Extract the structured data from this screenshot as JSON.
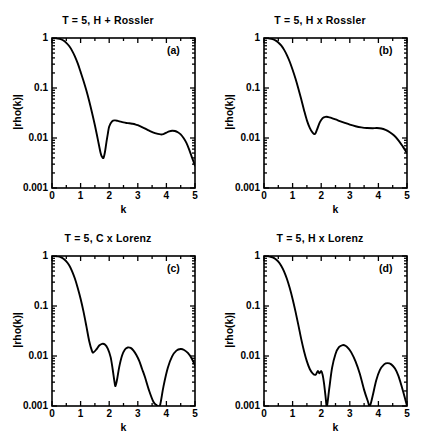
{
  "figure": {
    "background": "#ffffff",
    "ink": "#000000",
    "panel_count": 4
  },
  "shared": {
    "xlabel": "k",
    "ylabel": "|rho(k)|",
    "xticks": [
      "0",
      "1",
      "2",
      "3",
      "4",
      "5"
    ],
    "yticks": [
      "1",
      "0.1",
      "0.01",
      "0.001"
    ],
    "xlim": [
      0,
      5
    ],
    "ylim": [
      0.001,
      1
    ],
    "yscale": "log",
    "grid": false,
    "legend": "none"
  },
  "chart_data": [
    {
      "type": "line",
      "panel": "a",
      "tag": "(a)",
      "title": "T = 5,  H + Rossler",
      "xlabel": "k",
      "ylabel": "|rho(k)|",
      "xlim": [
        0,
        5
      ],
      "ylim": [
        0.001,
        1
      ],
      "yscale": "log",
      "grid": false,
      "xticks": [
        "0",
        "1",
        "2",
        "3",
        "4",
        "5"
      ],
      "yticks": [
        "1",
        "0.1",
        "0.01",
        "0.001"
      ],
      "x": [
        0.0,
        0.1,
        0.2,
        0.3,
        0.4,
        0.5,
        0.6,
        0.7,
        0.8,
        0.9,
        1.0,
        1.1,
        1.2,
        1.3,
        1.4,
        1.5,
        1.6,
        1.7,
        1.75,
        1.8,
        1.85,
        1.9,
        1.95,
        2.0,
        2.1,
        2.2,
        2.3,
        2.4,
        2.5,
        2.6,
        2.7,
        2.8,
        2.9,
        3.0,
        3.2,
        3.4,
        3.6,
        3.8,
        3.9,
        4.0,
        4.1,
        4.2,
        4.3,
        4.4,
        4.5,
        4.6,
        4.7,
        4.8,
        4.9,
        5.0
      ],
      "y": [
        1.0,
        0.995,
        0.98,
        0.95,
        0.89,
        0.8,
        0.69,
        0.56,
        0.43,
        0.31,
        0.21,
        0.14,
        0.09,
        0.055,
        0.032,
        0.018,
        0.0095,
        0.005,
        0.0042,
        0.004,
        0.0052,
        0.008,
        0.012,
        0.017,
        0.0215,
        0.0225,
        0.022,
        0.0212,
        0.0205,
        0.02,
        0.0197,
        0.0193,
        0.0188,
        0.018,
        0.016,
        0.014,
        0.0125,
        0.0118,
        0.012,
        0.0128,
        0.0136,
        0.014,
        0.0138,
        0.013,
        0.0118,
        0.01,
        0.008,
        0.0058,
        0.004,
        0.0028
      ]
    },
    {
      "type": "line",
      "panel": "b",
      "tag": "(b)",
      "title": "T = 5,  H x Rossler",
      "xlabel": "k",
      "ylabel": "|rho(k)|",
      "xlim": [
        0,
        5
      ],
      "ylim": [
        0.001,
        1
      ],
      "yscale": "log",
      "grid": false,
      "xticks": [
        "0",
        "1",
        "2",
        "3",
        "4",
        "5"
      ],
      "yticks": [
        "1",
        "0.1",
        "0.01",
        "0.001"
      ],
      "x": [
        0.0,
        0.1,
        0.2,
        0.3,
        0.4,
        0.5,
        0.6,
        0.7,
        0.8,
        0.9,
        1.0,
        1.1,
        1.2,
        1.3,
        1.4,
        1.5,
        1.6,
        1.7,
        1.78,
        1.85,
        1.95,
        2.05,
        2.15,
        2.25,
        2.35,
        2.5,
        2.65,
        2.8,
        3.0,
        3.2,
        3.4,
        3.6,
        3.8,
        3.95,
        4.1,
        4.25,
        4.4,
        4.55,
        4.7,
        4.85,
        5.0
      ],
      "y": [
        1.0,
        0.995,
        0.98,
        0.95,
        0.895,
        0.815,
        0.71,
        0.585,
        0.455,
        0.335,
        0.232,
        0.155,
        0.098,
        0.06,
        0.036,
        0.0225,
        0.016,
        0.0128,
        0.012,
        0.0145,
        0.0205,
        0.025,
        0.0265,
        0.0262,
        0.0252,
        0.0235,
        0.0218,
        0.0203,
        0.0185,
        0.0172,
        0.0163,
        0.0158,
        0.0157,
        0.0158,
        0.0155,
        0.0145,
        0.013,
        0.0112,
        0.009,
        0.0068,
        0.005
      ]
    },
    {
      "type": "line",
      "panel": "c",
      "tag": "(c)",
      "title": "T = 5,  C x Lorenz",
      "xlabel": "k",
      "ylabel": "|rho(k)|",
      "xlim": [
        0,
        5
      ],
      "ylim": [
        0.001,
        1
      ],
      "yscale": "log",
      "grid": false,
      "xticks": [
        "0",
        "1",
        "2",
        "3",
        "4",
        "5"
      ],
      "yticks": [
        "1",
        "0.1",
        "0.01",
        "0.001"
      ],
      "x": [
        0.0,
        0.1,
        0.2,
        0.3,
        0.4,
        0.5,
        0.6,
        0.7,
        0.8,
        0.9,
        1.0,
        1.1,
        1.2,
        1.3,
        1.4,
        1.45,
        1.55,
        1.65,
        1.75,
        1.85,
        1.95,
        2.05,
        2.12,
        2.18,
        2.22,
        2.28,
        2.35,
        2.45,
        2.55,
        2.65,
        2.75,
        2.85,
        2.95,
        3.05,
        3.15,
        3.25,
        3.4,
        3.55,
        3.65,
        3.7,
        3.78,
        3.9,
        4.05,
        4.2,
        4.35,
        4.5,
        4.62,
        4.75,
        4.88,
        5.0
      ],
      "y": [
        1.0,
        0.995,
        0.98,
        0.945,
        0.88,
        0.78,
        0.65,
        0.5,
        0.355,
        0.23,
        0.14,
        0.078,
        0.04,
        0.02,
        0.0125,
        0.0118,
        0.0135,
        0.0162,
        0.0175,
        0.017,
        0.014,
        0.0095,
        0.0055,
        0.0032,
        0.0025,
        0.0035,
        0.006,
        0.0102,
        0.0135,
        0.0148,
        0.0145,
        0.0128,
        0.0105,
        0.008,
        0.0055,
        0.0038,
        0.002,
        0.0012,
        0.00105,
        0.001,
        0.00105,
        0.0025,
        0.0058,
        0.0098,
        0.0128,
        0.0138,
        0.0132,
        0.0115,
        0.009,
        0.0065
      ]
    },
    {
      "type": "line",
      "panel": "d",
      "tag": "(d)",
      "title": "T = 5,  H x Lorenz",
      "xlabel": "k",
      "ylabel": "|rho(k)|",
      "xlim": [
        0,
        5
      ],
      "ylim": [
        0.001,
        1
      ],
      "yscale": "log",
      "grid": false,
      "xticks": [
        "0",
        "1",
        "2",
        "3",
        "4",
        "5"
      ],
      "yticks": [
        "1",
        "0.1",
        "0.01",
        "0.001"
      ],
      "x": [
        0.0,
        0.1,
        0.2,
        0.3,
        0.4,
        0.5,
        0.6,
        0.7,
        0.8,
        0.9,
        1.0,
        1.1,
        1.2,
        1.3,
        1.4,
        1.5,
        1.6,
        1.7,
        1.8,
        1.88,
        1.94,
        2.0,
        2.05,
        2.1,
        2.15,
        2.2,
        2.28,
        2.38,
        2.5,
        2.62,
        2.75,
        2.85,
        2.95,
        3.05,
        3.2,
        3.35,
        3.5,
        3.62,
        3.7,
        3.8,
        3.92,
        4.05,
        4.2,
        4.32,
        4.45,
        4.58,
        4.7,
        4.82,
        4.92,
        5.0
      ],
      "y": [
        1.0,
        0.995,
        0.978,
        0.942,
        0.875,
        0.772,
        0.64,
        0.495,
        0.35,
        0.228,
        0.138,
        0.078,
        0.042,
        0.022,
        0.0125,
        0.0078,
        0.0055,
        0.0045,
        0.0042,
        0.005,
        0.0045,
        0.005,
        0.0042,
        0.0028,
        0.0016,
        0.001,
        0.0022,
        0.0058,
        0.011,
        0.015,
        0.0165,
        0.016,
        0.0142,
        0.0118,
        0.0078,
        0.0044,
        0.0021,
        0.0013,
        0.001,
        0.0016,
        0.0032,
        0.0052,
        0.0068,
        0.0072,
        0.0068,
        0.0056,
        0.004,
        0.0024,
        0.0015,
        0.001
      ]
    }
  ]
}
